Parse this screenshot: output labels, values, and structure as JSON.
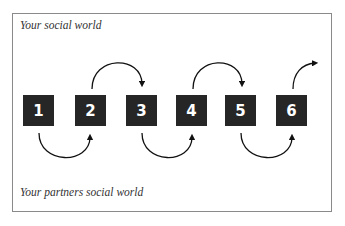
{
  "labels": {
    "top": "Your social world",
    "bottom": "Your partners social world"
  },
  "steps": [
    {
      "number": "1"
    },
    {
      "number": "2"
    },
    {
      "number": "3"
    },
    {
      "number": "4"
    },
    {
      "number": "5"
    },
    {
      "number": "6"
    }
  ],
  "colors": {
    "box_fill": "#262626",
    "box_text": "#ffffff",
    "arrow": "#111111",
    "frame_border": "#8a8a8a"
  }
}
